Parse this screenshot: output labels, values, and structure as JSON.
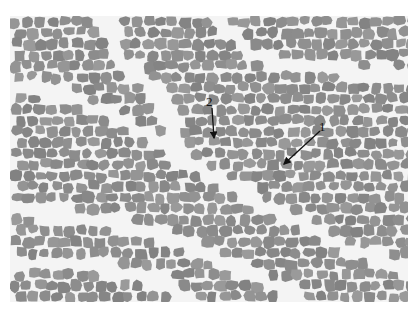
{
  "figure": {
    "background_color": "#ffffff",
    "fiber_color": "#8f8f8f",
    "connective_tissue_color": "#f4f4f4",
    "annotations": [
      {
        "label": "1",
        "label_pos": [
          323,
          128
        ],
        "arrow_from": [
          320,
          131
        ],
        "arrow_to": [
          284,
          164
        ]
      },
      {
        "label": "2",
        "label_pos": [
          210,
          103
        ],
        "arrow_from": [
          212,
          108
        ],
        "arrow_to": [
          214,
          138
        ]
      }
    ]
  }
}
